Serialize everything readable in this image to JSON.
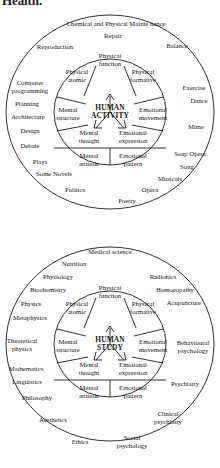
{
  "page": {
    "cut_off_heading": "Health.",
    "background_color": "#ffffff",
    "stroke_color": "#1a1a1a",
    "width": 220,
    "height": 468
  },
  "diagrams": [
    {
      "id": "human-activity",
      "core_label_line1": "HUMAN",
      "core_label_line2": "ACTIVITY",
      "inner_sectors": [
        {
          "name": "physical-function",
          "label": "Physical function",
          "line1": "Physical",
          "line2": "function",
          "x": 110,
          "y": 60
        },
        {
          "name": "physical-atomic",
          "label": "Physical atomic",
          "line1": "Physical",
          "line2": "atomic",
          "x": 77,
          "y": 76
        },
        {
          "name": "physical-formative",
          "label": "Physical formative",
          "line1": "Physical",
          "line2": "formative",
          "x": 143,
          "y": 76
        },
        {
          "name": "mental-structure",
          "label": "Mental structure",
          "line1": "Mental",
          "line2": "structure",
          "x": 68,
          "y": 114
        },
        {
          "name": "emotional-movement",
          "label": "Emotional movement",
          "line1": "Emotional",
          "line2": "movement",
          "x": 153,
          "y": 114
        },
        {
          "name": "mental-thought",
          "label": "Mental thought",
          "line1": "Mental",
          "line2": "thought",
          "x": 89,
          "y": 137
        },
        {
          "name": "emotional-expression",
          "label": "Emotional expression",
          "line1": "Emotional",
          "line2": "expression",
          "x": 133,
          "y": 137
        },
        {
          "name": "mental-attitude",
          "label": "Mental attitude",
          "line1": "Mental",
          "line2": "attitude",
          "x": 89,
          "y": 160
        },
        {
          "name": "emotional-pattern",
          "label": "Emotional pattern",
          "line1": "Emotional",
          "line2": "pattern",
          "x": 133,
          "y": 160
        }
      ],
      "outer_labels": [
        {
          "name": "chemical-and-physical-maintenance",
          "text": "Chemical and Physical Mainte nance",
          "x": 116,
          "y": 24,
          "wrap": false
        },
        {
          "name": "repair",
          "text": "Repair",
          "x": 113,
          "y": 36,
          "wrap": false
        },
        {
          "name": "reproduction",
          "text": "Reproduction",
          "x": 55,
          "y": 47,
          "wrap": false
        },
        {
          "name": "balance",
          "text": "Balance",
          "x": 177,
          "y": 46,
          "wrap": false
        },
        {
          "name": "computer-programming",
          "text": "Computer programming",
          "x": 30,
          "y": 86,
          "wrap": true
        },
        {
          "name": "exercise",
          "text": "Exercise",
          "x": 194,
          "y": 88,
          "wrap": false
        },
        {
          "name": "dance",
          "text": "Dance",
          "x": 199,
          "y": 101,
          "wrap": false
        },
        {
          "name": "planning",
          "text": "Planning",
          "x": 27,
          "y": 104,
          "wrap": false
        },
        {
          "name": "architecture",
          "text": "Architecture",
          "x": 28,
          "y": 117,
          "wrap": false
        },
        {
          "name": "mime",
          "text": "Mime",
          "x": 196,
          "y": 127,
          "wrap": false
        },
        {
          "name": "design",
          "text": "Design",
          "x": 30,
          "y": 131,
          "wrap": false
        },
        {
          "name": "debate",
          "text": "Debate",
          "x": 30,
          "y": 146,
          "wrap": false
        },
        {
          "name": "soap-opera",
          "text": "Soap Opera",
          "x": 190,
          "y": 154,
          "wrap": false
        },
        {
          "name": "plays",
          "text": "Plays",
          "x": 40,
          "y": 162,
          "wrap": false
        },
        {
          "name": "song",
          "text": "Song",
          "x": 187,
          "y": 167,
          "wrap": false
        },
        {
          "name": "some-novels",
          "text": "Some Novels",
          "x": 54,
          "y": 174,
          "wrap": false
        },
        {
          "name": "musicals",
          "text": "Musicals",
          "x": 170,
          "y": 179,
          "wrap": false
        },
        {
          "name": "politics",
          "text": "Politics",
          "x": 75,
          "y": 190,
          "wrap": false
        },
        {
          "name": "opera",
          "text": "Opera",
          "x": 150,
          "y": 190,
          "wrap": false
        },
        {
          "name": "poetry",
          "text": "Poetry",
          "x": 127,
          "y": 201,
          "wrap": false
        }
      ]
    },
    {
      "id": "human-study",
      "core_label_line1": "HUMAN",
      "core_label_line2": "STUDY",
      "inner_sectors": [
        {
          "name": "physical-function",
          "label": "Physical function",
          "line1": "Physical",
          "line2": "function",
          "x": 110,
          "y": 292
        },
        {
          "name": "physical-atomic",
          "label": "Physical atomic",
          "line1": "Physical",
          "line2": "atomic",
          "x": 77,
          "y": 308
        },
        {
          "name": "physical-formative",
          "label": "Physical formative",
          "line1": "Physical",
          "line2": "formative",
          "x": 143,
          "y": 308
        },
        {
          "name": "mental-structure",
          "label": "Mental structure",
          "line1": "Mental",
          "line2": "structure",
          "x": 68,
          "y": 346
        },
        {
          "name": "emotional-movement",
          "label": "Emotional movement",
          "line1": "Emotional",
          "line2": "movement",
          "x": 153,
          "y": 346
        },
        {
          "name": "mental-thought",
          "label": "Mental thought",
          "line1": "Mental",
          "line2": "thought",
          "x": 89,
          "y": 369
        },
        {
          "name": "emotional-expression",
          "label": "Emotional expression",
          "line1": "Emotional",
          "line2": "expression",
          "x": 133,
          "y": 369
        },
        {
          "name": "mental-attitude",
          "label": "Mental attitude",
          "line1": "Mental",
          "line2": "attitude",
          "x": 89,
          "y": 392
        },
        {
          "name": "emotional-pattern",
          "label": "Emotional pattern",
          "line1": "Emotional",
          "line2": "pattern",
          "x": 133,
          "y": 392
        }
      ],
      "outer_labels": [
        {
          "name": "medical-science",
          "text": "Medical science",
          "x": 110,
          "y": 252,
          "wrap": false
        },
        {
          "name": "nutrition",
          "text": "Nutrition",
          "x": 74,
          "y": 264,
          "wrap": false
        },
        {
          "name": "physiology",
          "text": "Physiology",
          "x": 58,
          "y": 277,
          "wrap": false
        },
        {
          "name": "radionics",
          "text": "Radionics",
          "x": 163,
          "y": 277,
          "wrap": false
        },
        {
          "name": "biochemistry",
          "text": "Biochemistry",
          "x": 48,
          "y": 290,
          "wrap": false
        },
        {
          "name": "homoeopathy",
          "text": "Homoeopathy",
          "x": 175,
          "y": 290,
          "wrap": false
        },
        {
          "name": "physics",
          "text": "Physics",
          "x": 31,
          "y": 304,
          "wrap": false
        },
        {
          "name": "acupuncture",
          "text": "Acupuncture",
          "x": 184,
          "y": 303,
          "wrap": false
        },
        {
          "name": "metaphysics",
          "text": "Metaphysics",
          "x": 30,
          "y": 318,
          "wrap": false
        },
        {
          "name": "theoretical-physics",
          "text": "Theoretical physics",
          "x": 22,
          "y": 344,
          "wrap": true
        },
        {
          "name": "behavioural-psychology",
          "text": "Behavioural psychology",
          "x": 193,
          "y": 346,
          "wrap": true
        },
        {
          "name": "mathematics",
          "text": "Mathematics",
          "x": 26,
          "y": 369,
          "wrap": false
        },
        {
          "name": "linguistics",
          "text": "Linguistics",
          "x": 27,
          "y": 382,
          "wrap": false
        },
        {
          "name": "psychiatry",
          "text": "Psychiatry",
          "x": 185,
          "y": 384,
          "wrap": false
        },
        {
          "name": "philosophy",
          "text": "Philosophy",
          "x": 37,
          "y": 398,
          "wrap": false
        },
        {
          "name": "clinical-psychiatry",
          "text": "Clinical psychiatry",
          "x": 168,
          "y": 417,
          "wrap": true
        },
        {
          "name": "aesthetics",
          "text": "Aesthetics",
          "x": 53,
          "y": 420,
          "wrap": false
        },
        {
          "name": "social-psychology",
          "text": "Social psychology",
          "x": 132,
          "y": 441,
          "wrap": true
        },
        {
          "name": "ethics",
          "text": "Ethics",
          "x": 80,
          "y": 442,
          "wrap": false
        }
      ]
    }
  ]
}
